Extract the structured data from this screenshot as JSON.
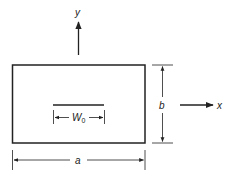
{
  "diagram": {
    "labels": {
      "y_axis": "y",
      "x_axis": "x",
      "width": "a",
      "height": "b",
      "load_width": "W",
      "load_width_sub": "0"
    },
    "colors": {
      "stroke": "#222222",
      "background": "#ffffff"
    }
  }
}
